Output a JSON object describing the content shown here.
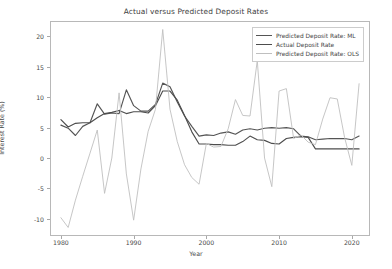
{
  "chart_data": {
    "type": "line",
    "title": "Actual versus Predicted Deposit Rates",
    "xlabel": "Year",
    "ylabel": "Interest Rate (%)",
    "xlim": [
      1978.5,
      1922.5
    ],
    "xlim_actual": [
      1978.5,
      2022.5
    ],
    "ylim": [
      -12.8,
      22.5
    ],
    "grid": false,
    "legend_position": "upper right",
    "xticks": [
      1980,
      1990,
      2000,
      2010,
      2020
    ],
    "yticks": [
      -10,
      -5,
      0,
      5,
      10,
      15,
      20
    ],
    "x": [
      1980,
      1981,
      1982,
      1983,
      1984,
      1985,
      1986,
      1987,
      1988,
      1989,
      1990,
      1991,
      1992,
      1993,
      1994,
      1995,
      1996,
      1997,
      1998,
      1999,
      2000,
      2001,
      2002,
      2003,
      2004,
      2005,
      2006,
      2007,
      2008,
      2009,
      2010,
      2011,
      2012,
      2013,
      2014,
      2015,
      2016,
      2017,
      2018,
      2019,
      2020,
      2021
    ],
    "series": [
      {
        "name": "Predicted Deposit Rate: ML",
        "color": "#555555",
        "values": [
          5.4,
          4.9,
          3.7,
          5.2,
          5.8,
          8.9,
          7.2,
          7.4,
          7.3,
          11.2,
          8.6,
          7.7,
          7.7,
          8.8,
          12.3,
          11.7,
          9.2,
          6.9,
          5.2,
          3.6,
          3.8,
          3.7,
          4.1,
          4.3,
          3.9,
          4.6,
          4.8,
          4.6,
          4.9,
          5.0,
          4.9,
          5.0,
          4.8,
          3.6,
          3.5,
          3.0,
          3.1,
          3.2,
          3.2,
          3.2,
          3.0,
          3.6
        ]
      },
      {
        "name": "Actual Deposit Rate",
        "color": "#4d4d4d",
        "values": [
          6.3,
          5.1,
          5.7,
          5.8,
          5.8,
          6.6,
          7.3,
          7.5,
          7.8,
          7.3,
          7.6,
          7.6,
          7.4,
          8.6,
          11.0,
          11.0,
          9.5,
          7.0,
          4.3,
          2.3,
          2.3,
          2.2,
          2.2,
          2.1,
          2.1,
          2.7,
          3.6,
          3.0,
          2.9,
          2.4,
          2.3,
          3.2,
          3.4,
          3.5,
          3.4,
          1.5,
          1.5,
          1.5,
          1.5,
          1.5,
          1.5,
          1.5
        ]
      },
      {
        "name": "Predicted Deposit Rate: OLS",
        "color": "#bfbfbf",
        "values": [
          -9.8,
          -11.4,
          -6.9,
          -3.0,
          0.8,
          4.6,
          -5.8,
          0.0,
          10.7,
          -2.6,
          -10.2,
          -1.8,
          4.4,
          8.0,
          21.1,
          8.0,
          2.7,
          -1.1,
          -3.2,
          -4.3,
          2.4,
          1.8,
          1.9,
          4.8,
          9.6,
          7.0,
          6.9,
          16.0,
          0.0,
          -4.7,
          11.0,
          11.4,
          3.2,
          3.8,
          2.6,
          2.2,
          6.4,
          9.9,
          9.7,
          3.4,
          -1.2,
          12.2
        ]
      }
    ]
  },
  "axes": {
    "ytick_labels": [
      "20",
      "15",
      "10",
      "5",
      "0",
      "-5",
      "-10"
    ],
    "xtick_labels": [
      "1980",
      "1990",
      "2000",
      "2010",
      "2020"
    ]
  },
  "legend": {
    "items": [
      {
        "label": "Predicted Deposit Rate: ML",
        "color": "#555555"
      },
      {
        "label": "Actual Deposit Rate",
        "color": "#4d4d4d"
      },
      {
        "label": "Predicted Deposit Rate: OLS",
        "color": "#bfbfbf"
      }
    ]
  }
}
